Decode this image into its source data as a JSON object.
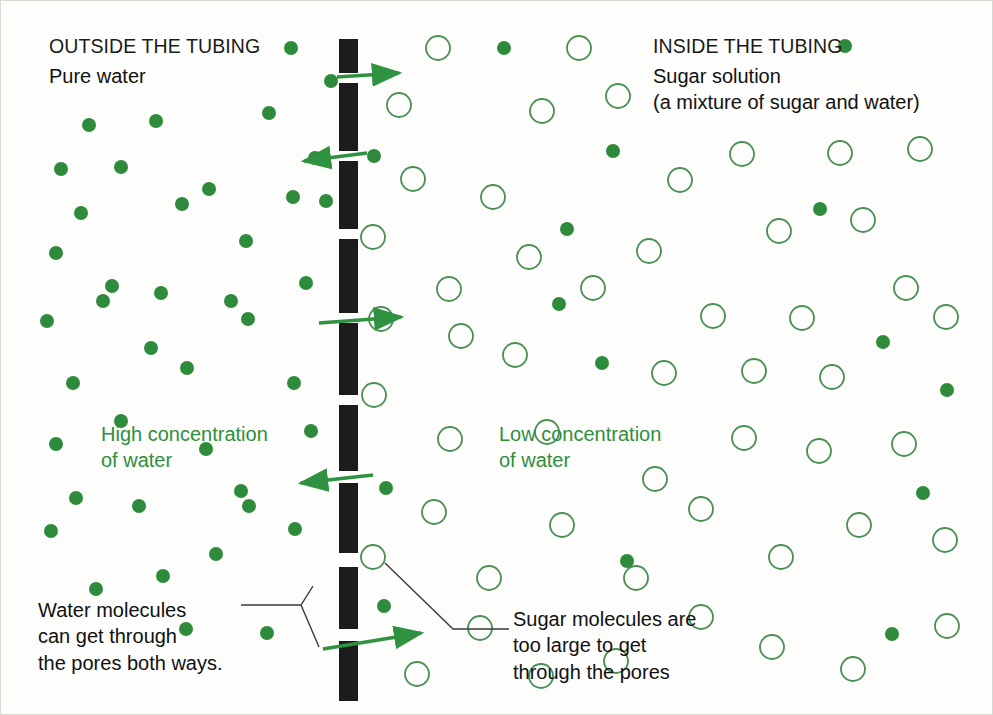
{
  "diagram": {
    "title_outside": "OUTSIDE THE TUBING",
    "subtitle_outside": "Pure water",
    "title_inside": "INSIDE THE TUBING",
    "subtitle_inside": "Sugar solution\n(a mixture of sugar and water)",
    "label_high_concentration": "High concentration\nof water",
    "label_low_concentration": "Low concentration\nof water",
    "caption_water": "Water molecules\ncan get through\nthe pores both ways.",
    "caption_sugar": "Sugar molecules are\ntoo large to get\nthrough the pores"
  },
  "colors": {
    "background": "#fdfdfb",
    "water_molecule": "#2e8b3c",
    "sugar_molecule_stroke": "#4a8f53",
    "membrane": "#1c1c1c",
    "arrow": "#2f9241",
    "text_dark": "#111111",
    "text_green": "#2f8f3f",
    "leader_line": "#3a3a3a"
  },
  "chart_data": {
    "type": "scatter",
    "legend": [
      {
        "name": "water molecule",
        "marker": "filled-circle",
        "color": "#2e8b3c",
        "radius": 7
      },
      {
        "name": "sugar molecule",
        "marker": "open-circle",
        "color": "#4a8f53",
        "radius": 12
      }
    ],
    "membrane": {
      "x": 338,
      "width": 19,
      "color": "#1c1c1c",
      "segments": [
        [
          38,
          72
        ],
        [
          82,
          150
        ],
        [
          160,
          228
        ],
        [
          238,
          312
        ],
        [
          322,
          394
        ],
        [
          404,
          470
        ],
        [
          482,
          552
        ],
        [
          566,
          628
        ],
        [
          640,
          700
        ]
      ]
    },
    "arrows": [
      {
        "x1": 336,
        "y1": 76,
        "x2": 398,
        "y2": 72,
        "direction": "right"
      },
      {
        "x1": 366,
        "y1": 152,
        "x2": 303,
        "y2": 160,
        "direction": "left"
      },
      {
        "x1": 318,
        "y1": 322,
        "x2": 400,
        "y2": 316,
        "direction": "right"
      },
      {
        "x1": 372,
        "y1": 474,
        "x2": 300,
        "y2": 482,
        "direction": "left"
      },
      {
        "x1": 322,
        "y1": 648,
        "x2": 420,
        "y2": 632,
        "direction": "right"
      }
    ],
    "leader_lines": {
      "water": [
        [
          [
            240,
            604
          ],
          [
            300,
            604
          ],
          [
            312,
            585
          ]
        ],
        [
          [
            300,
            604
          ],
          [
            318,
            646
          ]
        ]
      ],
      "sugar": [
        [
          [
            384,
            562
          ],
          [
            452,
            628
          ],
          [
            508,
            628
          ]
        ]
      ]
    },
    "water_molecules_left": [
      [
        290,
        47
      ],
      [
        88,
        124
      ],
      [
        155,
        120
      ],
      [
        268,
        112
      ],
      [
        60,
        168
      ],
      [
        120,
        166
      ],
      [
        208,
        188
      ],
      [
        245,
        240
      ],
      [
        314,
        157
      ],
      [
        181,
        203
      ],
      [
        55,
        252
      ],
      [
        230,
        300
      ],
      [
        111,
        285
      ],
      [
        292,
        196
      ],
      [
        325,
        200
      ],
      [
        46,
        320
      ],
      [
        160,
        292
      ],
      [
        72,
        382
      ],
      [
        293,
        382
      ],
      [
        102,
        300
      ],
      [
        247,
        318
      ],
      [
        186,
        367
      ],
      [
        55,
        443
      ],
      [
        138,
        505
      ],
      [
        240,
        490
      ],
      [
        75,
        497
      ],
      [
        294,
        528
      ],
      [
        162,
        575
      ],
      [
        95,
        588
      ],
      [
        248,
        505
      ],
      [
        205,
        448
      ],
      [
        120,
        420
      ],
      [
        266,
        632
      ],
      [
        310,
        430
      ],
      [
        185,
        628
      ],
      [
        50,
        530
      ],
      [
        215,
        553
      ],
      [
        150,
        347
      ],
      [
        305,
        282
      ],
      [
        80,
        212
      ]
    ],
    "water_molecules_right": [
      [
        330,
        80
      ],
      [
        373,
        155
      ],
      [
        503,
        47
      ],
      [
        612,
        150
      ],
      [
        558,
        303
      ],
      [
        566,
        228
      ],
      [
        819,
        208
      ],
      [
        882,
        341
      ],
      [
        601,
        362
      ],
      [
        922,
        492
      ],
      [
        844,
        45
      ],
      [
        626,
        560
      ],
      [
        385,
        487
      ],
      [
        383,
        605
      ],
      [
        891,
        633
      ],
      [
        946,
        389
      ]
    ],
    "sugar_molecules": [
      [
        437,
        47
      ],
      [
        578,
        47
      ],
      [
        398,
        104
      ],
      [
        541,
        110
      ],
      [
        617,
        95
      ],
      [
        741,
        153
      ],
      [
        839,
        152
      ],
      [
        919,
        148
      ],
      [
        412,
        178
      ],
      [
        679,
        179
      ],
      [
        492,
        196
      ],
      [
        372,
        236
      ],
      [
        448,
        288
      ],
      [
        528,
        256
      ],
      [
        648,
        250
      ],
      [
        778,
        230
      ],
      [
        862,
        219
      ],
      [
        905,
        287
      ],
      [
        460,
        335
      ],
      [
        592,
        287
      ],
      [
        712,
        315
      ],
      [
        801,
        317
      ],
      [
        380,
        318
      ],
      [
        514,
        354
      ],
      [
        663,
        372
      ],
      [
        753,
        370
      ],
      [
        831,
        376
      ],
      [
        945,
        316
      ],
      [
        373,
        394
      ],
      [
        449,
        438
      ],
      [
        546,
        431
      ],
      [
        743,
        437
      ],
      [
        654,
        478
      ],
      [
        818,
        450
      ],
      [
        903,
        443
      ],
      [
        433,
        511
      ],
      [
        488,
        577
      ],
      [
        561,
        524
      ],
      [
        700,
        508
      ],
      [
        635,
        577
      ],
      [
        780,
        556
      ],
      [
        858,
        524
      ],
      [
        944,
        539
      ],
      [
        372,
        556
      ],
      [
        416,
        673
      ],
      [
        479,
        627
      ],
      [
        615,
        660
      ],
      [
        700,
        616
      ],
      [
        771,
        646
      ],
      [
        852,
        668
      ],
      [
        946,
        625
      ],
      [
        540,
        675
      ]
    ]
  }
}
